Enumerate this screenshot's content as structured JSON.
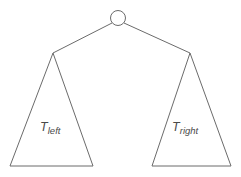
{
  "diagram": {
    "kind": "binary-tree-decomposition",
    "background_color": "#ffffff",
    "stroke_color": "#6b6b6b",
    "text_color": "#4a4a4a",
    "root": {
      "shape": "circle",
      "label": "",
      "center_x": 118,
      "center_y": 18,
      "radius": 7.5
    },
    "edges": [
      {
        "name": "root-to-left-subtree",
        "from_x": 112,
        "from_y": 23,
        "to_x": 53,
        "to_y": 53
      },
      {
        "name": "root-to-right-subtree",
        "from_x": 124,
        "from_y": 23,
        "to_x": 190,
        "to_y": 53
      }
    ],
    "subtrees": [
      {
        "name": "left-subtree",
        "label_base": "T",
        "label_subscript": "left",
        "apex_x": 53,
        "apex_y": 53,
        "base_left_x": 10,
        "base_right_x": 93,
        "base_y": 166
      },
      {
        "name": "right-subtree",
        "label_base": "T",
        "label_subscript": "right",
        "apex_x": 190,
        "apex_y": 53,
        "base_left_x": 152,
        "base_right_x": 231,
        "base_y": 166
      }
    ]
  }
}
